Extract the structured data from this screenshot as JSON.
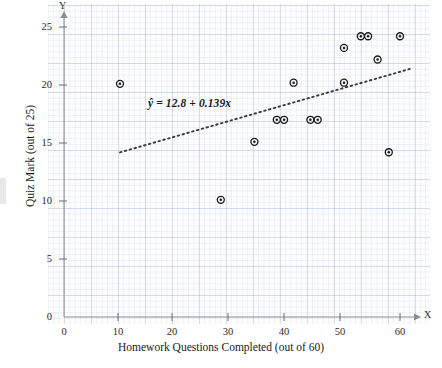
{
  "figure": {
    "x_axis_letter": "X",
    "y_axis_letter": "Y",
    "x_title": "Homework Questions Completed (out of 60)",
    "y_title": "Quiz Mark (out of 25)",
    "equation_text": "ŷ = 12.8 + 0.139x",
    "marker_color": "#1c1c1c",
    "line_color": "#3a3a3a",
    "grid_color": "#96a8c4"
  },
  "chart_data": {
    "type": "scatter",
    "title": "",
    "xlabel": "Homework Questions Completed (out of 60)",
    "ylabel": "Quiz Mark (out of 25)",
    "xlim": [
      0,
      62
    ],
    "ylim": [
      0,
      26
    ],
    "xticks": [
      0,
      10,
      20,
      30,
      40,
      50,
      60
    ],
    "yticks": [
      0,
      5,
      10,
      15,
      20,
      25
    ],
    "xtick_labels": [
      "0",
      "10",
      "20",
      "30",
      "40",
      "50",
      "60"
    ],
    "ytick_labels": [
      "0",
      "5",
      "10",
      "15",
      "20",
      "25"
    ],
    "grid": true,
    "legend": "none",
    "points": [
      {
        "x": 10,
        "y": 20.1
      },
      {
        "x": 28,
        "y": 10.1
      },
      {
        "x": 34,
        "y": 15.1
      },
      {
        "x": 38,
        "y": 17.0
      },
      {
        "x": 39.3,
        "y": 17.0
      },
      {
        "x": 41,
        "y": 20.2
      },
      {
        "x": 44,
        "y": 17.0
      },
      {
        "x": 45.3,
        "y": 17.0
      },
      {
        "x": 50,
        "y": 23.2
      },
      {
        "x": 50,
        "y": 20.2
      },
      {
        "x": 53,
        "y": 24.2
      },
      {
        "x": 54.3,
        "y": 24.2
      },
      {
        "x": 56,
        "y": 22.2
      },
      {
        "x": 58,
        "y": 14.2
      },
      {
        "x": 60,
        "y": 24.2
      }
    ],
    "fit_line": {
      "style": "dotted",
      "equation": "ŷ = 12.8 + 0.139x",
      "intercept": 12.8,
      "slope": 0.139,
      "x_start": 10,
      "x_end": 62
    }
  }
}
